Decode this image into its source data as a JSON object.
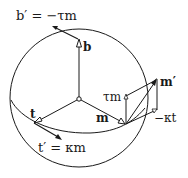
{
  "diagram": {
    "type": "frenet-frame-on-sphere",
    "colors": {
      "ink": "#1a1a1a",
      "background": "#ffffff"
    },
    "labels": {
      "b_prime": "b′ = −τm",
      "b": "b",
      "t": "t",
      "t_prime": "t′ = κm",
      "m": "m",
      "tau_m": "τm",
      "m_prime": "m′",
      "minus_kappa_t": "−κt"
    }
  }
}
